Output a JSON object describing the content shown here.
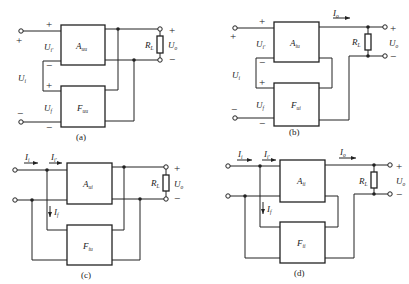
{
  "figure": {
    "panels": [
      {
        "id": "a",
        "caption": "(a)",
        "amp_label": "A",
        "amp_sub": "uu",
        "fb_label": "F",
        "fb_sub": "uu",
        "labels": {
          "input_voltage": "U",
          "input_voltage_sub": "i",
          "net_input": "U",
          "net_input_sub": "i'",
          "feedback_voltage": "U",
          "feedback_voltage_sub": "f",
          "load": "R",
          "load_sub": "L",
          "output": "U",
          "output_sub": "o"
        },
        "signs": {
          "plus": "+",
          "minus": "−"
        }
      },
      {
        "id": "b",
        "caption": "(b)",
        "amp_label": "A",
        "amp_sub": "iu",
        "fb_label": "F",
        "fb_sub": "ui",
        "labels": {
          "input_voltage": "U",
          "input_voltage_sub": "i",
          "net_input": "U",
          "net_input_sub": "i'",
          "feedback_voltage": "U",
          "feedback_voltage_sub": "f",
          "output_current": "I",
          "output_current_sub": "o",
          "load": "R",
          "load_sub": "L",
          "output": "U",
          "output_sub": "o"
        },
        "signs": {
          "plus": "+",
          "minus": "−"
        }
      },
      {
        "id": "c",
        "caption": "(c)",
        "amp_label": "A",
        "amp_sub": "ui",
        "fb_label": "F",
        "fb_sub": "iu",
        "labels": {
          "input_current": "I",
          "input_current_sub": "i",
          "net_input_current": "I",
          "net_input_current_sub": "i'",
          "feedback_current": "I",
          "feedback_current_sub": "f",
          "load": "R",
          "load_sub": "L",
          "output": "U",
          "output_sub": "o"
        },
        "signs": {
          "plus": "+",
          "minus": "−"
        }
      },
      {
        "id": "d",
        "caption": "(d)",
        "amp_label": "A",
        "amp_sub": "ii",
        "fb_label": "F",
        "fb_sub": "ii",
        "labels": {
          "input_current": "I",
          "input_current_sub": "i",
          "net_input_current": "I",
          "net_input_current_sub": "i'",
          "feedback_current": "I",
          "feedback_current_sub": "f",
          "output_current": "I",
          "output_current_sub": "o",
          "load": "R",
          "load_sub": "L",
          "output": "U",
          "output_sub": "o"
        },
        "signs": {
          "plus": "+",
          "minus": "−"
        }
      }
    ]
  }
}
